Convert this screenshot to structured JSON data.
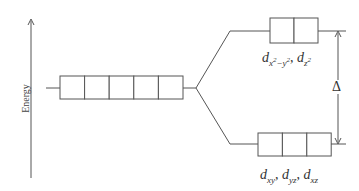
{
  "diagram": {
    "axis_label": "Energy",
    "degenerate_level": {
      "orbital_count": 5
    },
    "upper_level": {
      "orbital_count": 2,
      "labels": [
        "d",
        "x",
        "2",
        "−y",
        "2",
        ", ",
        "d",
        "z",
        "2"
      ],
      "label_text": "d_{x²−y²}, d_{z²}"
    },
    "lower_level": {
      "orbital_count": 3,
      "labels": [
        "d",
        "xy",
        ", ",
        "d",
        "yz",
        ", ",
        "d",
        "xz"
      ],
      "label_text": "d_{xy}, d_{yz}, d_{xz}"
    },
    "splitting_label": "Δ",
    "colors": {
      "line": "#555555",
      "text": "#333333",
      "background": "#ffffff"
    }
  }
}
